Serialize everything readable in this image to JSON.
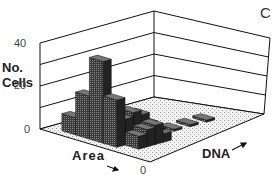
{
  "panel_label": "C",
  "chart_data": {
    "type": "bar3d",
    "title": "",
    "zlabel": "No. Cells",
    "xlabel": "Area",
    "ylabel": "DNA",
    "z_ticks": [
      "0",
      "20",
      "40"
    ],
    "zlim": [
      0,
      40
    ],
    "x_origin_label": "0",
    "grid": true,
    "bars": [
      {
        "area": 3,
        "dna": 1,
        "count": 38
      },
      {
        "area": 2,
        "dna": 1,
        "count": 20
      },
      {
        "area": 4,
        "dna": 1,
        "count": 22
      },
      {
        "area": 1,
        "dna": 1,
        "count": 8
      },
      {
        "area": 3,
        "dna": 2,
        "count": 16
      },
      {
        "area": 4,
        "dna": 2,
        "count": 12
      },
      {
        "area": 5,
        "dna": 2,
        "count": 6
      },
      {
        "area": 3,
        "dna": 3,
        "count": 10
      },
      {
        "area": 4,
        "dna": 3,
        "count": 14
      },
      {
        "area": 5,
        "dna": 3,
        "count": 8
      },
      {
        "area": 2,
        "dna": 3,
        "count": 4
      },
      {
        "area": 4,
        "dna": 4,
        "count": 12
      },
      {
        "area": 5,
        "dna": 4,
        "count": 9
      },
      {
        "area": 3,
        "dna": 4,
        "count": 5
      },
      {
        "area": 4,
        "dna": 5,
        "count": 7
      },
      {
        "area": 5,
        "dna": 5,
        "count": 4
      },
      {
        "area": 3,
        "dna": 5,
        "count": 3
      },
      {
        "area": 4,
        "dna": 6,
        "count": 3
      },
      {
        "area": 4,
        "dna": 8,
        "count": 1
      },
      {
        "area": 4,
        "dna": 10,
        "count": 1
      },
      {
        "area": 4,
        "dna": 12,
        "count": 1
      }
    ],
    "colors": {
      "bar": "#2a2a2a",
      "floor": "#e6e6e6",
      "grid": "#111111"
    }
  }
}
